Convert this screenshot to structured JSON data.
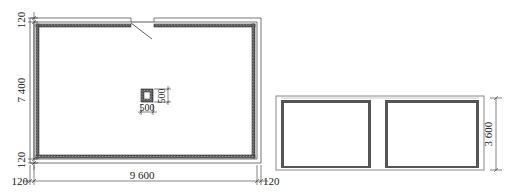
{
  "drawing": {
    "left_plan": {
      "dims": {
        "top_wall_thickness": "120",
        "height": "7 400",
        "bottom_wall_thickness": "120",
        "left_wall_thickness": "120",
        "width": "9 600",
        "right_wall_thickness": "120"
      },
      "column": {
        "width": "500",
        "height": "500"
      }
    },
    "right_plan": {
      "dims": {
        "height": "3 600"
      }
    },
    "colors": {
      "line": "#333333",
      "wall_fill": "#555555",
      "outline": "#888888",
      "background": "#ffffff"
    }
  }
}
